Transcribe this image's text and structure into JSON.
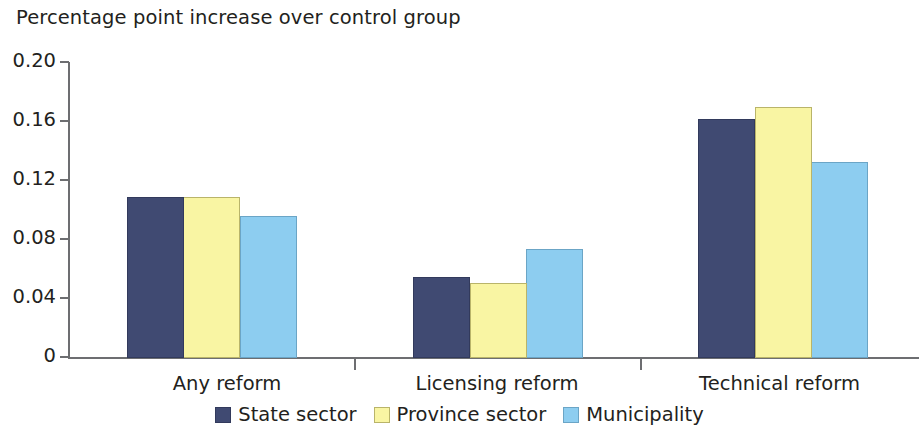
{
  "chart_data": {
    "type": "bar",
    "title": "Percentage point increase over control group",
    "xlabel": "",
    "ylabel": "",
    "ylim": [
      0,
      0.2
    ],
    "ytick_labels": [
      "0.20",
      "0.16",
      "0.12",
      "0.08",
      "0.04",
      "0"
    ],
    "ytick_values": [
      0.2,
      0.16,
      0.12,
      0.08,
      0.04,
      0
    ],
    "grid": false,
    "legend_position": "bottom-center",
    "categories": [
      "Any reform",
      "Licensing reform",
      "Technical reform"
    ],
    "series": [
      {
        "name": "State sector",
        "color": "#404a72",
        "values": [
          0.109,
          0.055,
          0.162
        ]
      },
      {
        "name": "Province sector",
        "color": "#f9f5a3",
        "values": [
          0.109,
          0.051,
          0.17
        ]
      },
      {
        "name": "Municipality",
        "color": "#8dcdf0",
        "values": [
          0.096,
          0.074,
          0.133
        ]
      }
    ]
  },
  "colors": {
    "axis": "#6d6e71",
    "text": "#231f20",
    "series_state": "#404a72",
    "series_province": "#f9f5a3",
    "series_municipality": "#8dcdf0",
    "background": "#ffffff"
  }
}
